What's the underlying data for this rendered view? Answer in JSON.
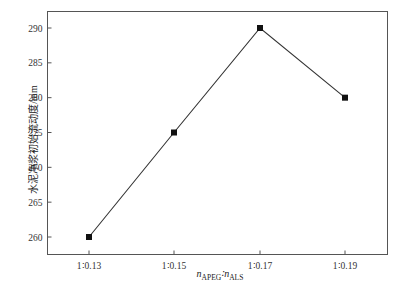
{
  "chart_data": {
    "type": "line",
    "title": "",
    "xlabel": "n_APEG : n_ALS",
    "ylabel": "水泥净浆初始流动度/mm",
    "categories": [
      "1∶0.13",
      "1∶0.15",
      "1∶0.17",
      "1∶0.19"
    ],
    "series": [
      {
        "name": "初始流动度",
        "values": [
          260,
          275,
          290,
          280
        ],
        "marker": "square"
      }
    ],
    "yticks": [
      260,
      265,
      270,
      275,
      280,
      285,
      290
    ],
    "ylim": [
      257.5,
      292.5
    ],
    "grid": false,
    "legend": null
  },
  "axis": {
    "ylabel": "水泥净浆初始流动度/mm",
    "xlabel_main_a": "n",
    "xlabel_sub_a": "APEG",
    "xlabel_sep": "∶",
    "xlabel_main_b": "n",
    "xlabel_sub_b": "ALS"
  }
}
